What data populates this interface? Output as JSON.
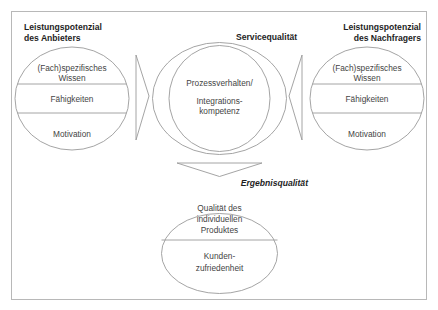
{
  "provider": {
    "title_line1": "Leistungspotenzial",
    "title_line2": "des Anbieters",
    "segments": [
      {
        "line1": "(Fach)spezifisches",
        "line2": "Wissen"
      },
      {
        "line1": "Fähigkeiten"
      },
      {
        "line1": "Motivation"
      }
    ]
  },
  "service": {
    "title": "Servicequalität",
    "line1": "Prozessverhalten/",
    "line2": "Integrations-",
    "line3": "kompetenz"
  },
  "customer": {
    "title_line1": "Leistungspotenzial",
    "title_line2": "des Nachfragers",
    "segments": [
      {
        "line1": "(Fach)spezifisches",
        "line2": "Wissen"
      },
      {
        "line1": "Fähigkeiten"
      },
      {
        "line1": "Motivation"
      }
    ]
  },
  "result": {
    "title": "Ergebnisqualität",
    "segments": [
      {
        "line1": "Qualität des",
        "line2": "individuellen",
        "line3": "Produktes"
      },
      {
        "line1": "Kunden-",
        "line2": "zufriedenheit"
      }
    ]
  },
  "colors": {
    "stroke": "#9a9a9a",
    "frame": "#b8b8b8",
    "text": "#444444",
    "heading": "#1e1e1e"
  }
}
